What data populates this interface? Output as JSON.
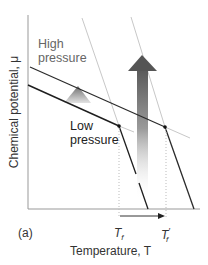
{
  "figure": {
    "panel_label": "(a)",
    "y_axis_label": "Chemical potential, μ",
    "x_axis_label": "Temperature, T",
    "curve_labels": {
      "high": "High\npressure",
      "high_line1": "High",
      "high_line2": "pressure",
      "low_line1": "Low",
      "low_line2": "pressure"
    },
    "tick_labels": {
      "t1_main": "T",
      "t1_sub": "f",
      "t1p_main": "T",
      "t1p_prime": "′",
      "t1p_sub": "f"
    },
    "annotations": [
      "large gradient arrow indicating increase in chemical potential with pressure",
      "small gradient triangle indicating shift of liquid line",
      "horizontal arrow from Tf to Tf′ indicating raised freezing point"
    ],
    "colors": {
      "dark_line": "#2b2b2b",
      "light_line": "#c8c8c8",
      "arrow_dark": "#555555",
      "text": "#333333"
    }
  }
}
